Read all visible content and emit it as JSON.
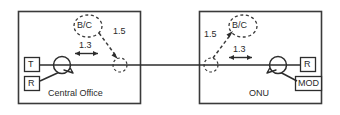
{
  "diagram": {
    "stroke_color": "#2d2d2d",
    "dashed_color": "#3a3a3a",
    "background": "#ffffff",
    "nodes": [
      {
        "id": "central-office",
        "caption": "Central Office",
        "ports": [
          {
            "id": "co-transmitter",
            "label": "T"
          },
          {
            "id": "co-receiver",
            "label": "R"
          }
        ],
        "coupler": {
          "id": "co-coupler",
          "label": ""
        },
        "bubble": {
          "id": "co-bc-bubble",
          "label": "B/C"
        },
        "wavelengths": [
          {
            "id": "co-wl-down",
            "label": "1.3"
          },
          {
            "id": "co-wl-up",
            "label": "1.5"
          }
        ]
      },
      {
        "id": "onu",
        "caption": "ONU",
        "ports": [
          {
            "id": "onu-receiver",
            "label": "R"
          },
          {
            "id": "onu-modulator",
            "label": "MOD"
          }
        ],
        "coupler": {
          "id": "onu-coupler",
          "label": ""
        },
        "bubble": {
          "id": "onu-bc-bubble",
          "label": "B/C"
        },
        "wavelengths": [
          {
            "id": "onu-wl-up",
            "label": "1.5"
          },
          {
            "id": "onu-wl-down",
            "label": "1.3"
          }
        ]
      }
    ],
    "fiber": {
      "id": "fiber-link",
      "label": ""
    }
  }
}
